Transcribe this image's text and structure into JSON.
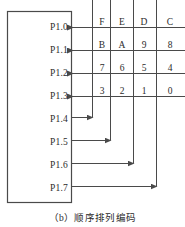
{
  "figure": {
    "caption": "（b）顺序排列编码",
    "caption_index": "b",
    "caption_text": "顺序排列编码"
  },
  "chip_block": {
    "name": "port-block",
    "ports": [
      {
        "label": "P1.0",
        "direction": "in",
        "row": 0
      },
      {
        "label": "P1.1",
        "direction": "in",
        "row": 1
      },
      {
        "label": "P1.2",
        "direction": "in",
        "row": 2
      },
      {
        "label": "P1.3",
        "direction": "in",
        "row": 3
      },
      {
        "label": "P1.4",
        "direction": "out",
        "row": 4
      },
      {
        "label": "P1.5",
        "direction": "out",
        "row": 5
      },
      {
        "label": "P1.6",
        "direction": "out",
        "row": 6
      },
      {
        "label": "P1.7",
        "direction": "out",
        "row": 7
      }
    ]
  },
  "keypad_matrix": {
    "columns": [
      "col0",
      "col1",
      "col2",
      "col3"
    ],
    "rows": [
      {
        "row_port": "P1.0",
        "keys": [
          "F",
          "E",
          "D",
          "C"
        ]
      },
      {
        "row_port": "P1.1",
        "keys": [
          "B",
          "A",
          "9",
          "8"
        ]
      },
      {
        "row_port": "P1.2",
        "keys": [
          "7",
          "6",
          "5",
          "4"
        ]
      },
      {
        "row_port": "P1.3",
        "keys": [
          "3",
          "2",
          "1",
          "0"
        ]
      }
    ],
    "column_ports": [
      "P1.4",
      "P1.5",
      "P1.6",
      "P1.7"
    ]
  },
  "cells": {
    "r0c0": "F",
    "r0c1": "E",
    "r0c2": "D",
    "r0c3": "C",
    "r1c0": "B",
    "r1c1": "A",
    "r1c2": "9",
    "r1c3": "8",
    "r2c0": "7",
    "r2c1": "6",
    "r2c2": "5",
    "r2c3": "4",
    "r3c0": "3",
    "r3c1": "2",
    "r3c2": "1",
    "r3c3": "0"
  },
  "ports": {
    "p0": "P1.0",
    "p1": "P1.1",
    "p2": "P1.2",
    "p3": "P1.3",
    "p4": "P1.4",
    "p5": "P1.5",
    "p6": "P1.6",
    "p7": "P1.7"
  },
  "colors": {
    "line": "#4a4a4a",
    "text": "#2b2b2b",
    "background": "#ffffff"
  }
}
